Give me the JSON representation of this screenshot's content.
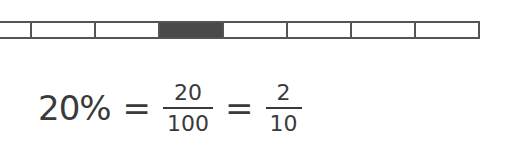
{
  "bar": {
    "cells": 10,
    "shaded_index": 3,
    "colors": {
      "shaded": "#4a4a4a",
      "border": "#555555",
      "empty": "#ffffff"
    }
  },
  "equation": {
    "percent": "20%",
    "eq1": "=",
    "frac1": {
      "numerator": "20",
      "denominator": "100"
    },
    "eq2": "=",
    "frac2": {
      "numerator": "2",
      "denominator": "10"
    }
  }
}
